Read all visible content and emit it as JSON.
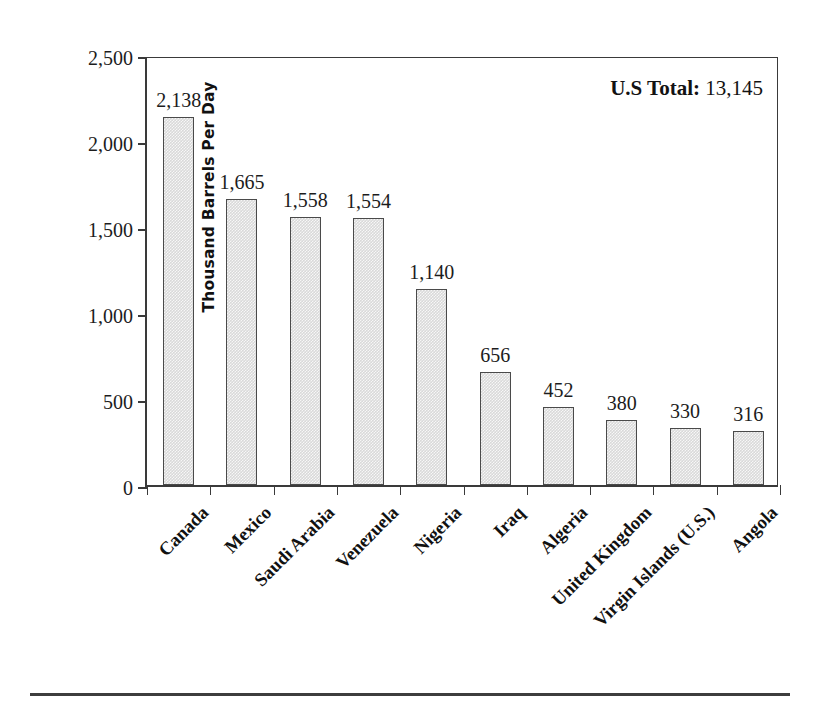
{
  "chart_data": {
    "type": "bar",
    "title": "",
    "xlabel": "",
    "ylabel": "Thousand Barrels Per Day",
    "ylim": [
      0,
      2500
    ],
    "ytick_values": [
      0,
      500,
      1000,
      1500,
      2000,
      2500
    ],
    "ytick_labels": [
      "0",
      "500",
      "1,000",
      "1,500",
      "2,000",
      "2,500"
    ],
    "grid": false,
    "legend": "none",
    "categories": [
      "Canada",
      "Mexico",
      "Saudi Arabia",
      "Venezuela",
      "Nigeria",
      "Iraq",
      "Algeria",
      "United Kingdom",
      "Virgin Islands (U.S.)",
      "Angola"
    ],
    "values": [
      2138,
      1665,
      1558,
      1554,
      1140,
      656,
      452,
      380,
      330,
      316
    ],
    "value_labels": [
      "2,138",
      "1,665",
      "1,558",
      "1,554",
      "1,140",
      "656",
      "452",
      "380",
      "330",
      "316"
    ],
    "annotations": [
      {
        "name": "us-total",
        "label": "U.S Total:",
        "value": "13,145",
        "position": "top-right"
      }
    ],
    "colors": {
      "bar_fill": "#d9d9d9",
      "bar_border": "#4a4a4a",
      "axis": "#3a3a3a",
      "text": "#1c1c1c",
      "background": "#ffffff"
    }
  }
}
